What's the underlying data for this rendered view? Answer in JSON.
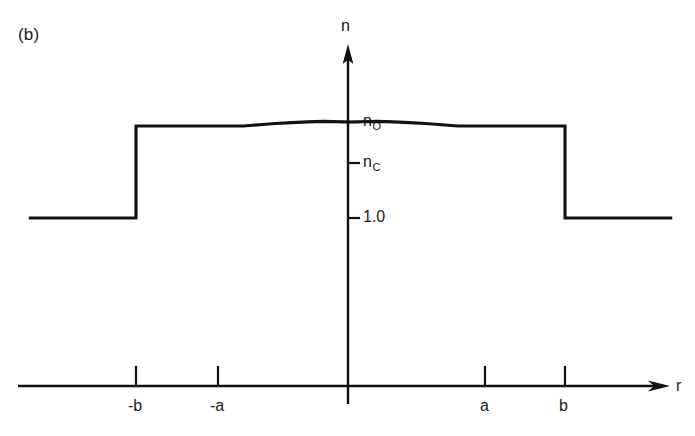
{
  "figure": {
    "panel_label": "(b)",
    "line_color": "#111111",
    "background_color": "#ffffff"
  },
  "axes": {
    "y": {
      "name": "n",
      "arrow": true,
      "ticks": [
        {
          "id": "n0",
          "label": "n",
          "subscript": "O",
          "value_px_y": 122
        },
        {
          "id": "nc",
          "label": "n",
          "subscript": "C",
          "value_px_y": 163
        },
        {
          "id": "one",
          "label": "1.0",
          "subscript": "",
          "value_px_y": 218
        }
      ]
    },
    "x": {
      "name": "r",
      "arrow": true,
      "ticks": [
        {
          "id": "minus-b",
          "label": "-b"
        },
        {
          "id": "minus-a",
          "label": "-a"
        },
        {
          "id": "a",
          "label": "a"
        },
        {
          "id": "b",
          "label": "b"
        }
      ]
    }
  },
  "chart_data": {
    "type": "line",
    "title": "(b)",
    "xlabel": "r",
    "ylabel": "n",
    "grid": false,
    "legend": null,
    "annotations": [
      "(b)"
    ],
    "x_tick_labels": [
      "-b",
      "-a",
      "a",
      "b"
    ],
    "x_tick_values": [
      -2.0,
      -1.0,
      1.0,
      2.0
    ],
    "y_tick_labels": [
      "n_O",
      "n_C",
      "1.0"
    ],
    "y_tick_values": [
      1.48,
      1.46,
      1.0
    ],
    "xlim": [
      -3.2,
      3.2
    ],
    "ylim": [
      0.0,
      1.62
    ],
    "series": [
      {
        "name": "refractive index profile n(r)",
        "comment": "Step-index cladding at 1.0 outside |r|>b, inner cladding step at n_C for a<|r|<b, parabolic graded core peaking at n_O at r=0",
        "x": [
          -3.0,
          -2.0,
          -2.0,
          -1.0,
          -0.85,
          -0.7,
          -0.55,
          -0.4,
          -0.25,
          0.0,
          0.25,
          0.4,
          0.55,
          0.7,
          0.85,
          1.0,
          2.0,
          2.0,
          3.0
        ],
        "y": [
          1.0,
          1.0,
          1.46,
          1.46,
          1.4665,
          1.4722,
          1.477,
          1.4808,
          1.4831,
          1.48,
          1.4831,
          1.4808,
          1.477,
          1.4722,
          1.4665,
          1.46,
          1.46,
          1.0,
          1.0
        ]
      }
    ]
  }
}
